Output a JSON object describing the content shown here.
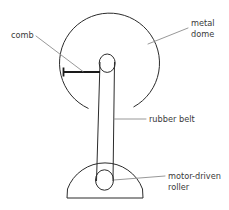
{
  "figure": {
    "background_color": "#ffffff",
    "line_color": "#2b2b2b",
    "leader_color": "#8c8c8c",
    "text_color": "#3a3a3a"
  },
  "labels": {
    "comb": {
      "text": "comb",
      "x": 11,
      "y": 38
    },
    "metal_dome_line1": {
      "text": "metal",
      "x": 191,
      "y": 26
    },
    "metal_dome_line2": {
      "text": "dome",
      "x": 191,
      "y": 37
    },
    "rubber_belt": {
      "text": "rubber belt",
      "x": 149,
      "y": 122
    },
    "motor_driven_roller_line1": {
      "text": "motor-driven",
      "x": 168,
      "y": 179
    },
    "motor_driven_roller_line2": {
      "text": "roller",
      "x": 168,
      "y": 190
    }
  },
  "parts": {
    "metal_dome": {
      "name": "metal dome",
      "shape": "open circle arc",
      "center_x": 110,
      "center_y": 61,
      "radius": 50
    },
    "top_roller": {
      "name": "top roller",
      "shape": "ellipse",
      "center_x": 107,
      "center_y": 63,
      "rx": 8,
      "ry": 9
    },
    "comb": {
      "name": "comb",
      "shape": "horizontal bar",
      "x1": 63,
      "x2": 100,
      "y": 72
    },
    "rubber_belt": {
      "name": "rubber belt",
      "shape": "two vertical lines",
      "left_top_x": 100,
      "left_bottom_x": 97,
      "right_top_x": 114,
      "right_bottom_x": 113,
      "top_y": 63,
      "bottom_y": 180
    },
    "base": {
      "name": "motor base",
      "shape": "semicircular dome with flat bottom",
      "left_x": 67,
      "right_x": 143,
      "bottom_y": 198,
      "apex_y": 160
    },
    "motor_driven_roller": {
      "name": "motor-driven roller",
      "shape": "ellipse",
      "center_x": 104,
      "center_y": 180,
      "rx": 9,
      "ry": 10
    }
  }
}
